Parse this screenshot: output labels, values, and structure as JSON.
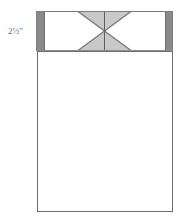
{
  "diagram": {
    "type": "pattern-schematic",
    "units": "inches",
    "canvas": {
      "width": 189,
      "height": 221
    },
    "labels": {
      "band_height": "2½\"",
      "band_height_value": 2.5
    },
    "colors": {
      "outline": "#6e6e6e",
      "outline_dark": "#4a4a4a",
      "side_bar_fill": "#8a8a8a",
      "triangle_fill": "#c9c9c9",
      "body_fill": "#ffffff",
      "band_fill": "#ffffff",
      "label_text": "#6b6b6b"
    },
    "parts": [
      {
        "name": "top-band",
        "label": "Top band",
        "x": 36,
        "y": 11,
        "width": 137,
        "height": 40
      },
      {
        "name": "left-side-bar",
        "label": "Left side bar",
        "x": 36,
        "y": 11,
        "width": 8,
        "height": 40
      },
      {
        "name": "right-side-bar",
        "label": "Right side bar",
        "x": 165,
        "y": 11,
        "width": 8,
        "height": 40
      },
      {
        "name": "hourglass-block",
        "label": "Hourglass block",
        "x": 78,
        "y": 11,
        "width": 53,
        "height": 40,
        "center_x": 104.5,
        "center_y": 31
      },
      {
        "name": "main-body",
        "label": "Main body panel",
        "x": 37,
        "y": 51,
        "width": 136,
        "height": 161
      }
    ],
    "shapes": {
      "band": {
        "x": 36,
        "y": 11,
        "w": 137,
        "h": 40
      },
      "left_bar": {
        "x": 36,
        "y": 11,
        "w": 8,
        "h": 40
      },
      "right_bar": {
        "x": 165,
        "y": 11,
        "w": 8,
        "h": 40
      },
      "hourglass": {
        "left": 78,
        "right": 131,
        "top": 11,
        "bottom": 51,
        "cx": 104.5,
        "cy": 31,
        "top_triangle": "78,11 131,11 104.5,31",
        "bottom_triangle": "78,51 131,51 104.5,31",
        "diag_1": {
          "x1": 78,
          "y1": 11,
          "x2": 131,
          "y2": 51
        },
        "diag_2": {
          "x1": 131,
          "y1": 11,
          "x2": 78,
          "y2": 51
        },
        "center_seam": {
          "x1": 104.5,
          "y1": 11,
          "x2": 104.5,
          "y2": 51
        }
      },
      "body": {
        "x": 37,
        "y": 51,
        "w": 136,
        "h": 161
      }
    }
  }
}
